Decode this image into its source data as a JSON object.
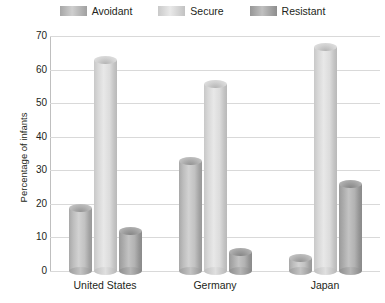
{
  "chart_data": {
    "type": "bar",
    "title": "",
    "subtitle": "",
    "xlabel": "",
    "ylabel": "Percentage of infants",
    "ylim": [
      0,
      70
    ],
    "ytick_values": [
      0,
      10,
      20,
      30,
      40,
      50,
      60,
      70
    ],
    "ytick_labels": [
      "0",
      "10",
      "20",
      "30",
      "40",
      "50",
      "60",
      "70"
    ],
    "grid": true,
    "legend_position": "top-center",
    "categories": [
      "United States",
      "Germany",
      "Japan"
    ],
    "series": [
      {
        "name": "Avoidant",
        "color": "#bdbdbd",
        "values": [
          20,
          34,
          5
        ]
      },
      {
        "name": "Secure",
        "color": "#dedede",
        "values": [
          64,
          57,
          68
        ]
      },
      {
        "name": "Resistant",
        "color": "#a8a8a8",
        "values": [
          13,
          7,
          27
        ]
      }
    ]
  }
}
